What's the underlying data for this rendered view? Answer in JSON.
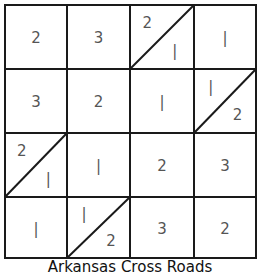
{
  "diagram": {
    "title": "Arkansas Cross Roads",
    "rows": 4,
    "cols": 4,
    "cells": [
      [
        {
          "value": "2"
        },
        {
          "value": "3"
        },
        {
          "split": "up",
          "top": "2",
          "bottom": "1"
        },
        {
          "value": "1"
        }
      ],
      [
        {
          "value": "3"
        },
        {
          "value": "2"
        },
        {
          "value": "1"
        },
        {
          "split": "up",
          "top": "1",
          "bottom": "2"
        }
      ],
      [
        {
          "split": "up",
          "top": "2",
          "bottom": "1"
        },
        {
          "value": "1"
        },
        {
          "value": "2"
        },
        {
          "value": "3"
        }
      ],
      [
        {
          "value": "1"
        },
        {
          "split": "up",
          "top": "1",
          "bottom": "2"
        },
        {
          "value": "3"
        },
        {
          "value": "2"
        }
      ]
    ]
  },
  "colors": {
    "line": "#1a1a1a",
    "text": "#555555"
  }
}
